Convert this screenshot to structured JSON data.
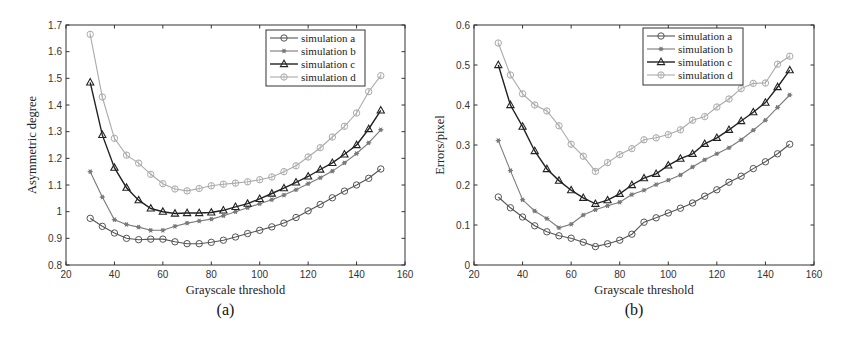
{
  "chart_data": [
    {
      "type": "line",
      "caption": "(a)",
      "title": "",
      "xlabel": "Grayscale threshold",
      "ylabel": "Asymmetric degree",
      "xlim": [
        20,
        160
      ],
      "ylim": [
        0.8,
        1.7
      ],
      "xticks": [
        20,
        40,
        60,
        80,
        100,
        120,
        140,
        160
      ],
      "yticks": [
        0.8,
        0.9,
        1,
        1.1,
        1.2,
        1.3,
        1.4,
        1.5,
        1.6,
        1.7
      ],
      "grid": false,
      "legend_position": "upper right",
      "x": [
        30,
        35,
        40,
        45,
        50,
        55,
        60,
        65,
        70,
        75,
        80,
        85,
        90,
        95,
        100,
        105,
        110,
        115,
        120,
        125,
        130,
        135,
        140,
        145,
        150
      ],
      "series": [
        {
          "name": "simulation a",
          "marker": "circle",
          "color": "#555555",
          "values": [
            0.975,
            0.945,
            0.92,
            0.9,
            0.895,
            0.897,
            0.897,
            0.887,
            0.88,
            0.88,
            0.885,
            0.893,
            0.905,
            0.918,
            0.93,
            0.943,
            0.957,
            0.978,
            1.003,
            1.027,
            1.052,
            1.077,
            1.1,
            1.125,
            1.16
          ]
        },
        {
          "name": "simulation b",
          "marker": "asterisk",
          "color": "#7a7a7a",
          "values": [
            1.15,
            1.055,
            0.97,
            0.952,
            0.942,
            0.93,
            0.93,
            0.945,
            0.957,
            0.965,
            0.972,
            0.985,
            1.0,
            1.015,
            1.03,
            1.045,
            1.062,
            1.082,
            1.105,
            1.127,
            1.152,
            1.183,
            1.218,
            1.258,
            1.307
          ]
        },
        {
          "name": "simulation c",
          "marker": "triangle",
          "color": "#222222",
          "values": [
            1.485,
            1.288,
            1.165,
            1.09,
            1.043,
            1.012,
            1.0,
            0.993,
            0.995,
            0.995,
            0.997,
            1.005,
            1.018,
            1.03,
            1.048,
            1.068,
            1.088,
            1.11,
            1.132,
            1.158,
            1.183,
            1.215,
            1.25,
            1.31,
            1.38
          ]
        },
        {
          "name": "simulation d",
          "marker": "diamond",
          "color": "#aaaaaa",
          "values": [
            1.665,
            1.43,
            1.275,
            1.212,
            1.182,
            1.14,
            1.105,
            1.085,
            1.078,
            1.087,
            1.097,
            1.103,
            1.107,
            1.112,
            1.12,
            1.13,
            1.15,
            1.172,
            1.205,
            1.24,
            1.28,
            1.32,
            1.37,
            1.45,
            1.51
          ]
        }
      ]
    },
    {
      "type": "line",
      "caption": "(b)",
      "title": "",
      "xlabel": "Grayscale threshold",
      "ylabel": "Errors/pixel",
      "xlim": [
        20,
        160
      ],
      "ylim": [
        0,
        0.6
      ],
      "xticks": [
        20,
        40,
        60,
        80,
        100,
        120,
        140,
        160
      ],
      "yticks": [
        0,
        0.1,
        0.2,
        0.3,
        0.4,
        0.5,
        0.6
      ],
      "grid": false,
      "legend_position": "upper right",
      "x": [
        30,
        35,
        40,
        45,
        50,
        55,
        60,
        65,
        70,
        75,
        80,
        85,
        90,
        95,
        100,
        105,
        110,
        115,
        120,
        125,
        130,
        135,
        140,
        145,
        150
      ],
      "series": [
        {
          "name": "simulation a",
          "marker": "circle",
          "color": "#555555",
          "values": [
            0.17,
            0.143,
            0.12,
            0.098,
            0.083,
            0.073,
            0.067,
            0.057,
            0.046,
            0.053,
            0.062,
            0.077,
            0.107,
            0.118,
            0.13,
            0.142,
            0.155,
            0.172,
            0.188,
            0.207,
            0.222,
            0.241,
            0.258,
            0.278,
            0.302
          ]
        },
        {
          "name": "simulation b",
          "marker": "asterisk",
          "color": "#7a7a7a",
          "values": [
            0.311,
            0.236,
            0.163,
            0.135,
            0.116,
            0.093,
            0.102,
            0.125,
            0.138,
            0.148,
            0.157,
            0.176,
            0.187,
            0.201,
            0.212,
            0.225,
            0.245,
            0.263,
            0.278,
            0.293,
            0.313,
            0.337,
            0.362,
            0.394,
            0.425
          ]
        },
        {
          "name": "simulation c",
          "marker": "triangle",
          "color": "#222222",
          "values": [
            0.5,
            0.4,
            0.346,
            0.285,
            0.24,
            0.211,
            0.187,
            0.168,
            0.153,
            0.162,
            0.178,
            0.2,
            0.217,
            0.228,
            0.249,
            0.266,
            0.278,
            0.303,
            0.318,
            0.338,
            0.36,
            0.382,
            0.406,
            0.445,
            0.487
          ]
        },
        {
          "name": "simulation d",
          "marker": "diamond",
          "color": "#aaaaaa",
          "values": [
            0.555,
            0.475,
            0.428,
            0.4,
            0.385,
            0.348,
            0.302,
            0.272,
            0.234,
            0.256,
            0.276,
            0.291,
            0.313,
            0.318,
            0.326,
            0.338,
            0.362,
            0.371,
            0.395,
            0.415,
            0.441,
            0.454,
            0.455,
            0.502,
            0.522
          ]
        }
      ]
    }
  ],
  "layout": [
    {
      "left": 66,
      "top": 25,
      "right": 405,
      "bottom": 265,
      "legend": {
        "x": 266,
        "y": 30,
        "w": 99,
        "h": 56
      }
    },
    {
      "left": 474,
      "top": 25,
      "right": 814,
      "bottom": 265,
      "legend": {
        "x": 643,
        "y": 28,
        "w": 100,
        "h": 57
      }
    }
  ]
}
